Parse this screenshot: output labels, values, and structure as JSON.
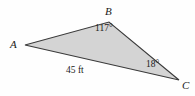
{
  "figure": {
    "type": "geometry-diagram",
    "shape": "triangle",
    "background_color": "#fefefe",
    "fill_color": "#d4d4d4",
    "stroke_color": "#3a3a3a",
    "vertices": [
      {
        "name": "A",
        "label": "A",
        "x": 25,
        "y": 45
      },
      {
        "name": "B",
        "label": "B",
        "x": 109,
        "y": 22
      },
      {
        "name": "C",
        "label": "C",
        "x": 179,
        "y": 80
      }
    ],
    "angles": [
      {
        "at": "B",
        "label": "117°"
      },
      {
        "at": "C",
        "label": "18°"
      }
    ],
    "sides": [
      {
        "from": "A",
        "to": "C",
        "label": "45 ft"
      }
    ]
  }
}
